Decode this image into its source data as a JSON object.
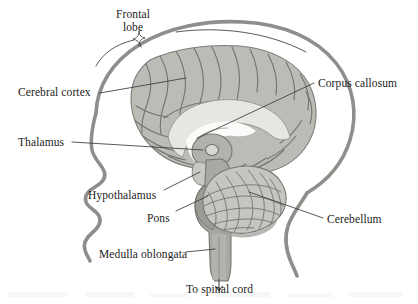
{
  "figure": {
    "labels": [
      {
        "id": "frontal-lobe",
        "text": "Frontal\nlobe",
        "line1": "Frontal",
        "line2": "lobe",
        "x": 118,
        "y": 9,
        "align": "center"
      },
      {
        "id": "cerebral-cortex",
        "text": "Cerebral cortex",
        "x": 18,
        "y": 89,
        "align": "left"
      },
      {
        "id": "thalamus",
        "text": "Thalamus",
        "x": 18,
        "y": 139,
        "align": "left"
      },
      {
        "id": "hypothalamus",
        "text": "Hypothalamus",
        "x": 90,
        "y": 192,
        "align": "left"
      },
      {
        "id": "pons",
        "text": "Pons",
        "x": 148,
        "y": 215,
        "align": "left"
      },
      {
        "id": "medulla-oblongata",
        "text": "Medulla oblongata",
        "x": 100,
        "y": 251,
        "align": "left"
      },
      {
        "id": "to-spinal-cord",
        "text": "To spinal cord",
        "x": 189,
        "y": 285,
        "align": "left"
      },
      {
        "id": "corpus-callosum",
        "text": "Corpus callosum",
        "x": 318,
        "y": 80,
        "align": "left"
      },
      {
        "id": "cerebellum",
        "text": "Cerebellum",
        "x": 327,
        "y": 216,
        "align": "left"
      }
    ],
    "colors": {
      "outline": "#8e8e8a",
      "cortex_fill": "#bcbcb7",
      "cortex_light": "#d5d5d1",
      "corpus_callosum": "#e6e6e2",
      "brainstem": "#a9a9a4",
      "cerebellum_fill": "#c6c6c1",
      "leader_line": "#3a3a3a",
      "text": "#1b1b1b",
      "background": "#ffffff"
    },
    "structures": [
      "head profile outline",
      "skull band",
      "cerebral cortex with gyri and sulci",
      "corpus callosum arch",
      "thalamus",
      "hypothalamus",
      "pons",
      "medulla oblongata",
      "cerebellum with folia",
      "spinal cord arrow"
    ]
  }
}
